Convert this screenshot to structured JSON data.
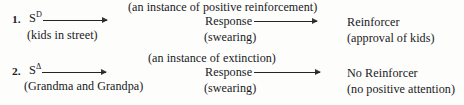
{
  "diagram": {
    "type": "three-term-contingency",
    "rows": [
      {
        "number": "1.",
        "stimulus": {
          "base": "S",
          "superscript": "D",
          "sub_label": "(kids in street)"
        },
        "annotation": "(an instance of positive reinforcement)",
        "response": {
          "label": "Response",
          "sub_label": "(swearing)"
        },
        "outcome": {
          "label": "Reinforcer",
          "sub_label": "(approval of kids)"
        },
        "arrows": [
          "stimulus-to-response-arrow",
          "response-to-outcome-arrow"
        ]
      },
      {
        "number": "2.",
        "stimulus": {
          "base": "S",
          "superscript": "Δ",
          "sub_label": "(Grandma and Grandpa)"
        },
        "annotation": "(an instance of extinction)",
        "response": {
          "label": "Response",
          "sub_label": "(swearing)"
        },
        "outcome": {
          "label": "No Reinforcer",
          "sub_label": "(no positive attention)"
        },
        "arrows": [
          "stimulus-to-response-arrow",
          "response-to-outcome-arrow"
        ]
      }
    ],
    "colors": {
      "ink": "#20201e",
      "background": "#fdfdfb",
      "rule": "#26261f"
    }
  }
}
